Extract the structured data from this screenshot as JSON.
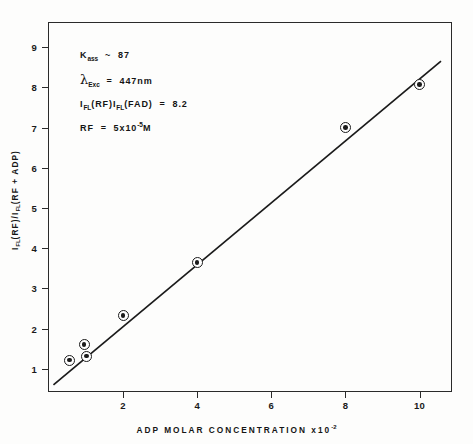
{
  "chart_data": {
    "type": "scatter",
    "title": "",
    "xlabel": "ADP MOLAR CONCENTRATION x10",
    "xlabel_exponent": "-2",
    "ylabel_parts": {
      "i1": "I",
      "sub1": "FL",
      "p1": "(RF)",
      "i2": "I",
      "sub2": "FL",
      "p2": "(RF + ADP)"
    },
    "xlim": [
      0,
      10.85
    ],
    "ylim": [
      0.45,
      9.6
    ],
    "xticks": [
      2,
      4,
      6,
      8,
      10
    ],
    "xtick_labels": [
      "2",
      "4",
      "6",
      "8",
      "10"
    ],
    "yticks": [
      1,
      2,
      3,
      4,
      5,
      6,
      7,
      8,
      9
    ],
    "ytick_labels": [
      "1",
      "2",
      "3",
      "4",
      "5",
      "6",
      "7",
      "8",
      "9"
    ],
    "grid": false,
    "legend": false,
    "points": [
      {
        "x": 0.55,
        "y": 1.22
      },
      {
        "x": 0.95,
        "y": 1.6
      },
      {
        "x": 1.02,
        "y": 1.32
      },
      {
        "x": 2.0,
        "y": 2.33
      },
      {
        "x": 4.0,
        "y": 3.65
      },
      {
        "x": 8.0,
        "y": 7.0
      },
      {
        "x": 10.0,
        "y": 8.07
      }
    ],
    "fit_line": {
      "x1": 0.12,
      "y1": 0.6,
      "x2": 10.58,
      "y2": 8.65
    },
    "marker_style": "circle-dot",
    "line_color": "#1b1b1b"
  },
  "annotations": [
    {
      "id": "binding-constant",
      "symbol": "K",
      "subscript": "ass",
      "relation": "~",
      "value": "87"
    },
    {
      "id": "excitation-wavelength",
      "symbol": "λ",
      "subscript": "Exc",
      "relation": "=",
      "value": "447nm"
    },
    {
      "id": "intensity-ratio",
      "text": "I",
      "sub_a": "FL",
      "paren_a": "(RF)",
      "sub_b": "FL",
      "paren_b": "(FAD)",
      "relation": "=",
      "value": "8.2"
    },
    {
      "id": "rf-concentration",
      "symbol": "RF",
      "relation": "=",
      "value": "5x10",
      "exponent": "-5",
      "unit": "M"
    }
  ],
  "colors": {
    "axis": "#2a2a2a",
    "data": "#1b1b1b",
    "background": "#fdfdfc"
  }
}
